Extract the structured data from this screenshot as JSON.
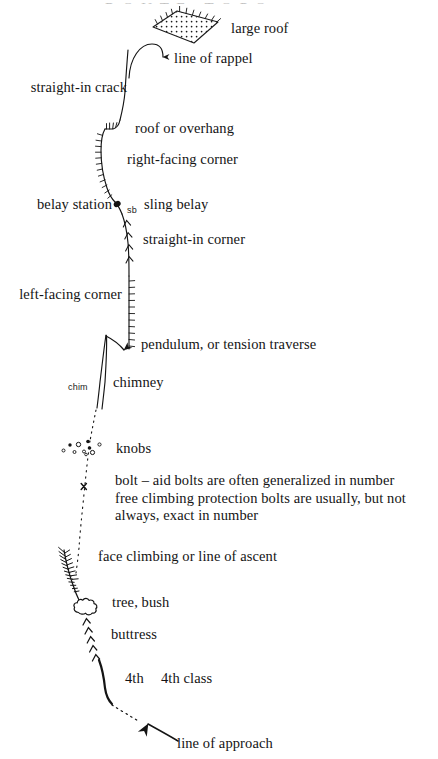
{
  "document": {
    "title": "Climbing Topo Legend",
    "page_background": "#ffffff",
    "ink_color": "#141414",
    "cut_off_header": "R O U T E   T O P O"
  },
  "labels": {
    "large_roof": "large roof",
    "line_of_rappel": "line of rappel",
    "straight_in_crack": "straight-in crack",
    "roof_or_overhang": "roof or overhang",
    "right_facing_corner": "right-facing corner",
    "belay_station": "belay station",
    "sb_marker": "sb",
    "sling_belay": "sling belay",
    "straight_in_corner": "straight-in corner",
    "left_facing_corner": "left-facing corner",
    "pendulum": "pendulum, or tension traverse",
    "chim_marker": "chim",
    "chimney": "chimney",
    "knobs": "knobs",
    "bolt_description": "bolt – aid bolts are often generalized in number\nfree climbing protection bolts are usually, but not\nalways, exact in number",
    "face_climbing": "face climbing or line of ascent",
    "tree_bush": "tree, bush",
    "buttress": "buttress",
    "fourth_marker": "4th",
    "fourth_class": "4th class",
    "line_of_approach": "line of approach"
  },
  "symbols": [
    {
      "name": "large-roof-symbol",
      "description": "stippled parallelogram with ticks on upper edges"
    },
    {
      "name": "rappel-arrow-symbol",
      "description": "curved line with downward arrowhead"
    },
    {
      "name": "straight-in-crack-symbol",
      "description": "plain curving line"
    },
    {
      "name": "roof-overhang-symbol",
      "description": "horizontal zigzag with upward ticks"
    },
    {
      "name": "right-facing-corner-symbol",
      "description": "vertical line with ticks on left"
    },
    {
      "name": "belay-station-symbol",
      "description": "solid dot on route line"
    },
    {
      "name": "straight-in-corner-symbol",
      "description": "vertical line with stacked upward chevrons"
    },
    {
      "name": "left-facing-corner-symbol",
      "description": "vertical line with ticks on right"
    },
    {
      "name": "pendulum-symbol",
      "description": "curved arrow from chimney top to corner"
    },
    {
      "name": "chimney-symbol",
      "description": "two parallel lines"
    },
    {
      "name": "knobs-symbol",
      "description": "cluster of small filled and hollow circles"
    },
    {
      "name": "bolt-symbol",
      "description": "small x on dotted line"
    },
    {
      "name": "face-climbing-symbol",
      "description": "dotted line of ascent"
    },
    {
      "name": "tree-bush-symbol",
      "description": "cloud-shaped outline"
    },
    {
      "name": "buttress-symbol",
      "description": "stacked chevron arrowheads"
    },
    {
      "name": "fourth-class-symbol",
      "description": "thick solid curved line"
    },
    {
      "name": "line-of-approach-symbol",
      "description": "straight arrow pointing up-left to dotted trail"
    }
  ]
}
